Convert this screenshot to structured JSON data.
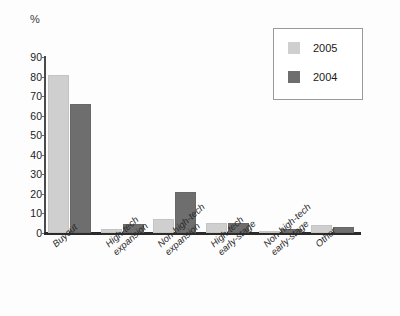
{
  "chart_data": {
    "type": "bar",
    "title": "",
    "subtitle": "",
    "xlabel": "",
    "ylabel": "%",
    "unit_label": "%",
    "ylim": [
      0,
      90
    ],
    "y_ticks": [
      0,
      10,
      20,
      30,
      40,
      50,
      60,
      70,
      80,
      90
    ],
    "grid": false,
    "legend_position": "top-right",
    "orientation": "vertical",
    "grouping": "grouped",
    "categories": [
      "Buyout",
      "High-tech\nexpansion",
      "Non-high-tech\nexpansion",
      "High-tech\nearly-stage",
      "Non-high-tech\nearly-stage",
      "Other"
    ],
    "series": [
      {
        "name": "2005",
        "color": "#cfcfcf",
        "values": [
          81,
          2,
          7,
          5,
          0.5,
          4
        ]
      },
      {
        "name": "2004",
        "color": "#6e6e6e",
        "values": [
          66,
          4.5,
          21,
          5,
          2,
          3
        ]
      }
    ]
  },
  "legend": {
    "entries": [
      {
        "label": "2005",
        "color": "#cfcfcf"
      },
      {
        "label": "2004",
        "color": "#6e6e6e"
      }
    ]
  },
  "axes": {
    "y_tick_labels": [
      "90",
      "80",
      "70",
      "60",
      "50",
      "40",
      "30",
      "20",
      "10",
      "0"
    ],
    "x_tick_labels": [
      "Buyout",
      "High-tech\nexpansion",
      "Non-high-tech\nexpansion",
      "High-tech\nearly-stage",
      "Non-high-tech\nearly-stage",
      "Other"
    ]
  }
}
